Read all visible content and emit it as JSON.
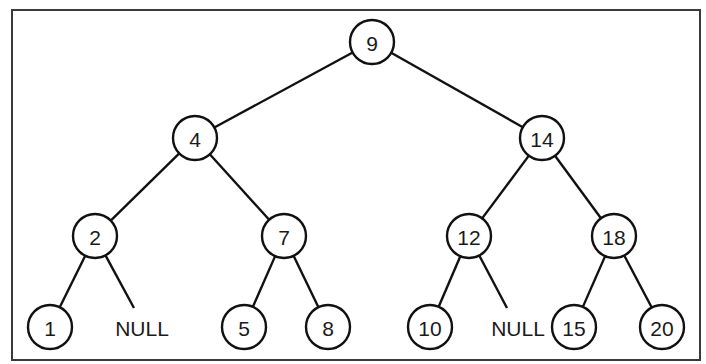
{
  "diagram": {
    "type": "binary-search-tree",
    "frame": {
      "x": 12,
      "y": 10,
      "width": 688,
      "height": 350
    },
    "node_radius": 22,
    "nodes": [
      {
        "id": "n9",
        "label": "9",
        "x": 372,
        "y": 42
      },
      {
        "id": "n4",
        "label": "4",
        "x": 195,
        "y": 138
      },
      {
        "id": "n14",
        "label": "14",
        "x": 542,
        "y": 138
      },
      {
        "id": "n2",
        "label": "2",
        "x": 95,
        "y": 236
      },
      {
        "id": "n7",
        "label": "7",
        "x": 284,
        "y": 236
      },
      {
        "id": "n12",
        "label": "12",
        "x": 469,
        "y": 236
      },
      {
        "id": "n18",
        "label": "18",
        "x": 614,
        "y": 236
      },
      {
        "id": "n1",
        "label": "1",
        "x": 50,
        "y": 327
      },
      {
        "id": "n5",
        "label": "5",
        "x": 244,
        "y": 327
      },
      {
        "id": "n8",
        "label": "8",
        "x": 328,
        "y": 327
      },
      {
        "id": "n10",
        "label": "10",
        "x": 430,
        "y": 327
      },
      {
        "id": "n15",
        "label": "15",
        "x": 574,
        "y": 327
      },
      {
        "id": "n20",
        "label": "20",
        "x": 662,
        "y": 327
      }
    ],
    "null_leaves": [
      {
        "id": "null-right-of-2",
        "label": "NULL",
        "x": 142,
        "y": 327,
        "line_end": {
          "x": 134,
          "y": 308
        }
      },
      {
        "id": "null-right-of-12",
        "label": "NULL",
        "x": 518,
        "y": 327,
        "line_end": {
          "x": 507,
          "y": 308
        }
      }
    ],
    "edges": [
      [
        "n9",
        "n4"
      ],
      [
        "n9",
        "n14"
      ],
      [
        "n4",
        "n2"
      ],
      [
        "n4",
        "n7"
      ],
      [
        "n14",
        "n12"
      ],
      [
        "n14",
        "n18"
      ],
      [
        "n2",
        "n1"
      ],
      [
        "n2",
        "null-right-of-2"
      ],
      [
        "n7",
        "n5"
      ],
      [
        "n7",
        "n8"
      ],
      [
        "n12",
        "n10"
      ],
      [
        "n12",
        "null-right-of-12"
      ],
      [
        "n18",
        "n15"
      ],
      [
        "n18",
        "n20"
      ]
    ]
  }
}
